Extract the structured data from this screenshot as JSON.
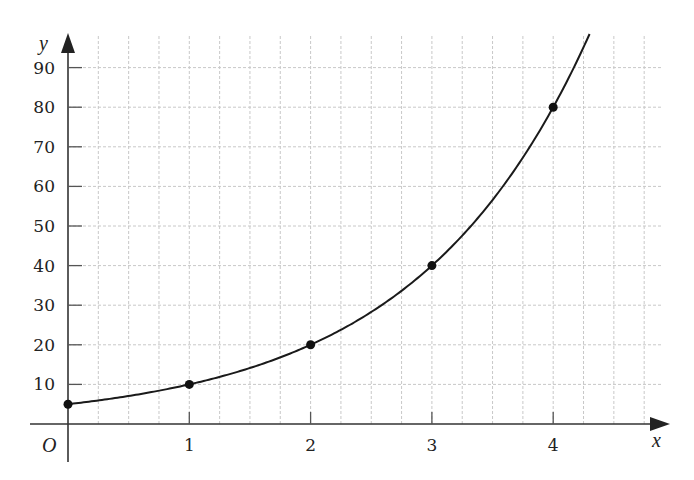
{
  "chart_data": {
    "type": "line",
    "title": "",
    "xlabel": "x",
    "ylabel": "y",
    "origin_label": "O",
    "function": "y = 5 * 2^x",
    "x_ticks": [
      1,
      2,
      3,
      4
    ],
    "y_ticks": [
      10,
      20,
      30,
      40,
      50,
      60,
      70,
      80,
      90
    ],
    "xlim": [
      0,
      4.75
    ],
    "ylim": [
      0,
      98
    ],
    "grid": {
      "vertical_step": 0.25,
      "horizontal_step": 10
    },
    "series": [
      {
        "name": "curve",
        "x": [
          0,
          1,
          2,
          3,
          4
        ],
        "values": [
          5,
          10,
          20,
          40,
          80
        ],
        "marked_points": true,
        "curve_extends_to_x": 4.3
      }
    ],
    "legend": null,
    "colors": {
      "line": "#1a1a1a",
      "grid": "#c8c8c8",
      "axis": "#333333"
    }
  }
}
